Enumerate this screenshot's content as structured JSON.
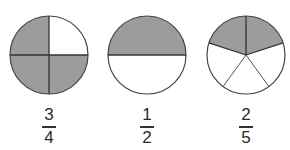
{
  "colors": {
    "shaded": "#9c9c9c",
    "unshaded": "#ffffff",
    "outline": "#444444"
  },
  "figures": [
    {
      "id": "three-quarters",
      "parts": 4,
      "shaded": 3,
      "division": "quadrants",
      "label": {
        "numerator": "3",
        "denominator": "4"
      }
    },
    {
      "id": "one-half",
      "parts": 2,
      "shaded": 1,
      "division": "horizontal-halves",
      "label": {
        "numerator": "1",
        "denominator": "2"
      }
    },
    {
      "id": "two-fifths",
      "parts": 5,
      "shaded": 2,
      "division": "fifths",
      "label": {
        "numerator": "2",
        "denominator": "5"
      }
    }
  ]
}
